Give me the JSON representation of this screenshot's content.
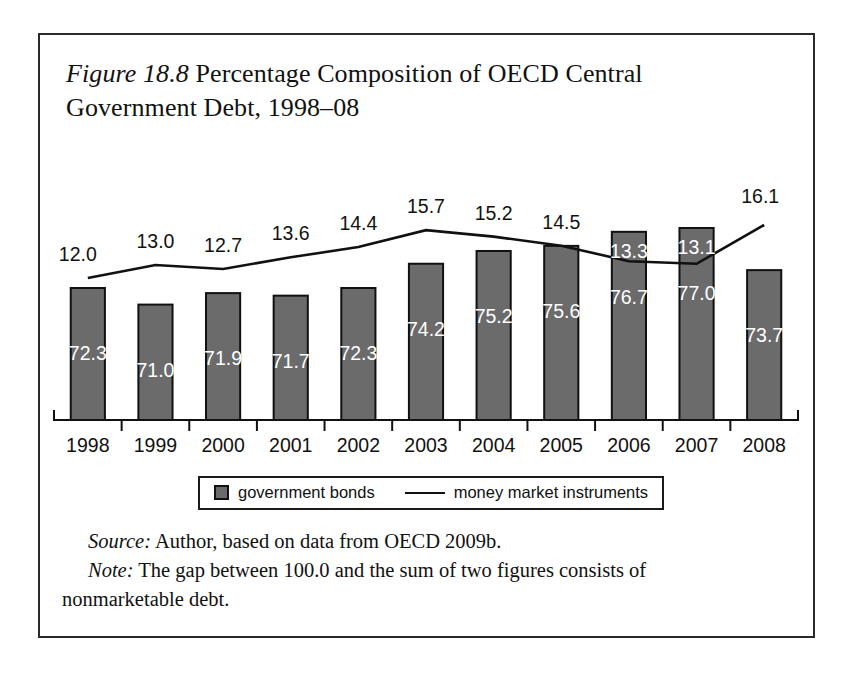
{
  "figure": {
    "label": "Figure 18.8",
    "title": " Percentage Composition of OECD Central Government Debt, 1998–08",
    "source_label": "Source:",
    "source_text": " Author, based on data from OECD 2009b.",
    "note_label": "Note:",
    "note_text": " The gap between 100.0 and the sum of two figures consists of",
    "note_text_cont": "nonmarketable debt."
  },
  "legend": {
    "bonds_label": "government bonds",
    "line_label": "money market instruments"
  },
  "colors": {
    "bar_fill": "#6b6b6b",
    "bar_stroke": "#111111",
    "line": "#111111",
    "axis": "#111111",
    "frame": "#2a2a2a",
    "bar_label_text": "#ffffff",
    "line_label_text": "#111111"
  },
  "chart_data": {
    "type": "bar",
    "title": "Percentage Composition of OECD Central Government Debt, 1998–08",
    "xlabel": "",
    "ylabel": "",
    "ylim": [
      0,
      100
    ],
    "grid": false,
    "legend_position": "bottom",
    "categories": [
      "1998",
      "1999",
      "2000",
      "2001",
      "2002",
      "2003",
      "2004",
      "2005",
      "2006",
      "2007",
      "2008"
    ],
    "series": [
      {
        "name": "government bonds",
        "type": "bar",
        "values": [
          72.3,
          71.0,
          71.9,
          71.7,
          72.3,
          74.2,
          75.2,
          75.6,
          76.7,
          77.0,
          73.7
        ],
        "labels": [
          "72.3",
          "71.0",
          "71.9",
          "71.7",
          "72.3",
          "74.2",
          "75.2",
          "75.6",
          "76.7",
          "77.0",
          "73.7"
        ]
      },
      {
        "name": "money market instruments",
        "type": "line",
        "values": [
          12.0,
          13.0,
          12.7,
          13.6,
          14.4,
          15.7,
          15.2,
          14.5,
          13.3,
          13.1,
          16.1
        ],
        "labels": [
          "12.0",
          "13.0",
          "12.7",
          "13.6",
          "14.4",
          "15.7",
          "15.2",
          "14.5",
          "13.3",
          "13.1",
          "16.1"
        ]
      }
    ]
  }
}
